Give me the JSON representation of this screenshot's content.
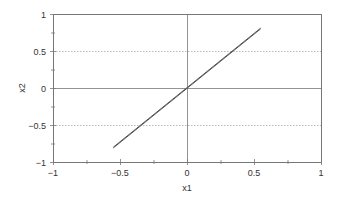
{
  "chart_data": {
    "type": "line",
    "title": "",
    "xlabel": "x1",
    "ylabel": "x2",
    "xlim": [
      -1,
      1
    ],
    "ylim": [
      -1,
      1
    ],
    "xticks": [
      -1,
      -0.5,
      0,
      0.5,
      1
    ],
    "yticks": [
      -1,
      -0.5,
      0,
      0.5,
      1
    ],
    "xtick_labels": [
      "−1",
      "−0.5",
      "0",
      "0.5",
      "1"
    ],
    "ytick_labels": [
      "−1",
      "−0.5",
      "0",
      "0.5",
      "1"
    ],
    "x_minor_ticks": [
      -0.75,
      -0.25,
      0.25,
      0.75
    ],
    "y_minor_ticks": [
      -0.75,
      -0.25,
      0.25,
      0.75
    ],
    "dotted_gridlines_y": [
      -0.5,
      0.5
    ],
    "solid_reference_lines": {
      "x": 0,
      "y": 0
    },
    "legend": "none",
    "series": [
      {
        "name": "branch-upper",
        "color": "#555555",
        "x": [
          -0.55,
          0.55
        ],
        "y": [
          -0.8,
          0.81
        ]
      },
      {
        "name": "branch-lower",
        "color": "#555555",
        "x": [
          -0.55,
          0.55
        ],
        "y": [
          -0.81,
          0.8
        ]
      }
    ]
  }
}
